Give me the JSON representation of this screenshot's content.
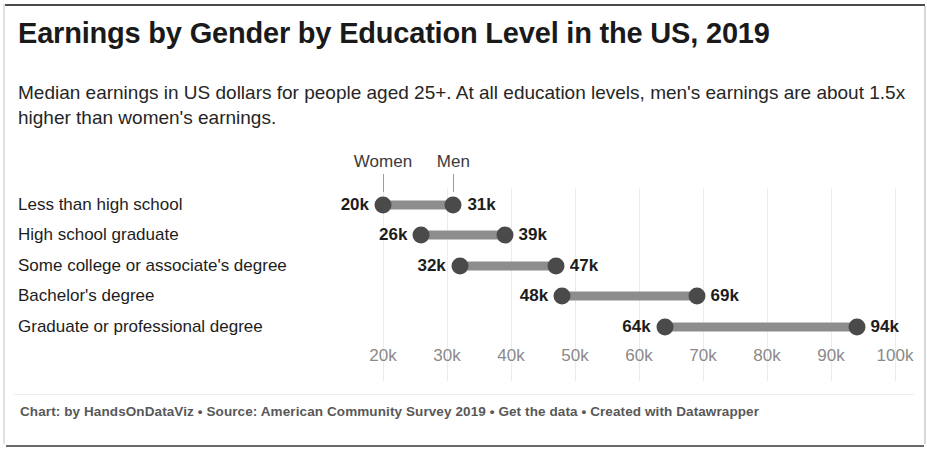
{
  "title": "Earnings by Gender by Education Level in the US, 2019",
  "subtitle": "Median earnings in US dollars for people aged 25+. At all education levels, men's earnings are about 1.5x higher than women's earnings.",
  "footer": "Chart: by HandsOnDataViz • Source: American Community Survey 2019 • Get the data • Created with Datawrapper",
  "legend": {
    "women_label": "Women",
    "men_label": "Men"
  },
  "colors": {
    "dot": "#4a4a4a",
    "connector": "#8d8d8d",
    "gridline": "#ebebeb",
    "text": "#1d1d1d",
    "tick_text": "#8a8a8a",
    "footer_text": "#585858",
    "background": "#ffffff"
  },
  "chart_data": {
    "type": "dumbbell",
    "title": "Earnings by Gender by Education Level in the US, 2019",
    "subtitle": "Median earnings in US dollars for people aged 25+. At all education levels, men's earnings are about 1.5x higher than women's earnings.",
    "xlabel": "",
    "ylabel": "",
    "xlim": [
      20,
      100
    ],
    "grid": true,
    "legend_position": "top-inline",
    "unit": "thousands of US dollars",
    "tick_labels": [
      "20k",
      "30k",
      "40k",
      "50k",
      "60k",
      "70k",
      "80k",
      "90k",
      "100k"
    ],
    "ticks": [
      20,
      30,
      40,
      50,
      60,
      70,
      80,
      90,
      100
    ],
    "categories": [
      "Less than high school",
      "High school graduate",
      "Some college or associate's degree",
      "Bachelor's degree",
      "Graduate or professional degree"
    ],
    "series": [
      {
        "name": "Women",
        "values": [
          20,
          26,
          32,
          48,
          64
        ]
      },
      {
        "name": "Men",
        "values": [
          31,
          39,
          47,
          69,
          94
        ]
      }
    ],
    "rows": [
      {
        "category": "Less than high school",
        "women": 20,
        "men": 31,
        "women_label": "20k",
        "men_label": "31k"
      },
      {
        "category": "High school graduate",
        "women": 26,
        "men": 39,
        "women_label": "26k",
        "men_label": "39k"
      },
      {
        "category": "Some college or associate's degree",
        "women": 32,
        "men": 47,
        "women_label": "32k",
        "men_label": "47k"
      },
      {
        "category": "Bachelor's degree",
        "women": 48,
        "men": 69,
        "women_label": "48k",
        "men_label": "69k"
      },
      {
        "category": "Graduate or professional degree",
        "women": 64,
        "men": 94,
        "women_label": "64k",
        "men_label": "94k"
      }
    ]
  }
}
